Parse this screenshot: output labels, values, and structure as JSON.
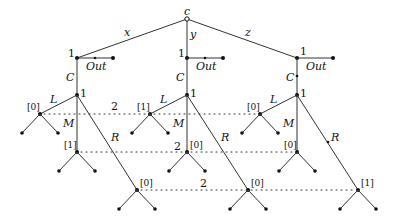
{
  "diagram": {
    "type": "extensive-form game tree",
    "root": {
      "label": "c"
    },
    "chance_moves": [
      "x",
      "y",
      "z"
    ],
    "player1_label": "1",
    "out_label": "Out",
    "continue_label": "C",
    "actions": {
      "L": "L",
      "M": "M",
      "R": "R"
    },
    "player2_label": "2",
    "beliefs": {
      "x": {
        "L": "[0]",
        "M": "[1]",
        "R": "[0]"
      },
      "y": {
        "L": "[1]",
        "M": "[0]",
        "R": "[0]"
      },
      "z": {
        "L": "[0]",
        "M": "[0]",
        "R": "[1]"
      }
    }
  }
}
